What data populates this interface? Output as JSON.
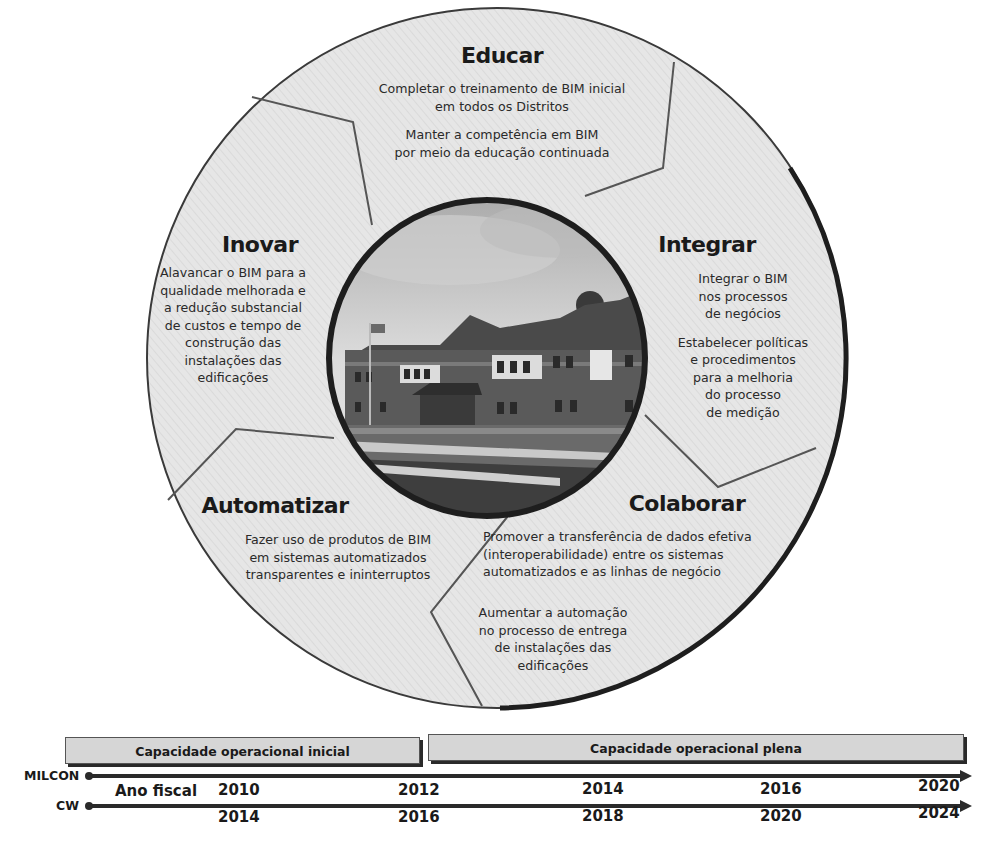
{
  "colors": {
    "ring_fill": "#e4e4e4",
    "outline": "#2a2a2a",
    "divider": "#555555",
    "phase_fill": "#d6d6d6",
    "text": "#1e1e1e"
  },
  "center_photo": {
    "description": "building-photo",
    "alt": "Two-story brick building with flagpole"
  },
  "segments": {
    "educar": {
      "title": "Educar",
      "lines": [
        "Completar o treinamento de BIM inicial",
        "em todos os Distritos",
        "Manter a competência em BIM",
        "por meio da educação continuada"
      ]
    },
    "integrar": {
      "title": "Integrar",
      "lines": [
        "Integrar o BIM",
        "nos processos",
        "de negócios",
        "Estabelecer políticas",
        "e procedimentos",
        "para a melhoria",
        "do processo",
        "de medição"
      ]
    },
    "colaborar": {
      "title": "Colaborar",
      "lines": [
        "Promover a transferência de dados efetiva",
        "(interoperabilidade) entre os sistemas",
        "automatizados e as linhas de negócio",
        "Aumentar a automação",
        "no processo de entrega",
        "de instalações das",
        "edificações"
      ]
    },
    "automatizar": {
      "title": "Automatizar",
      "lines": [
        "Fazer uso de produtos de BIM",
        "em sistemas automatizados",
        "transparentes e ininterruptos"
      ]
    },
    "inovar": {
      "title": "Inovar",
      "lines": [
        "Alavancar o BIM para a",
        "qualidade melhorada e",
        "a redução substancial",
        "de custos e tempo de",
        "construção das",
        "instalações das",
        "edificações"
      ]
    }
  },
  "timeline": {
    "phases": [
      {
        "label": "Capacidade operacional inicial"
      },
      {
        "label": "Capacidade operacional plena"
      }
    ],
    "fiscal_label": "Ano fiscal",
    "tracks": [
      {
        "label": "MILCON",
        "years": [
          "2010",
          "2012",
          "2014",
          "2016",
          "2020"
        ]
      },
      {
        "label": "CW",
        "years": [
          "2014",
          "2016",
          "2018",
          "2020",
          "2024"
        ]
      }
    ]
  }
}
